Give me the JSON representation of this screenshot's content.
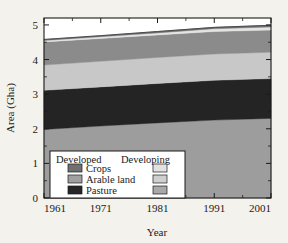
{
  "chart_data": {
    "type": "area",
    "title": "",
    "subtitle": "",
    "xlabel": "Year",
    "ylabel": "Area (Gha)",
    "xlim": [
      1961,
      2001
    ],
    "ylim": [
      0,
      5.2
    ],
    "xticks": [
      1961,
      1971,
      1981,
      1991,
      2001
    ],
    "xticklabels": [
      "1961",
      "1971",
      "1981",
      "1991",
      "2001"
    ],
    "yticks": [
      0,
      1,
      2,
      3,
      4,
      5
    ],
    "yticklabels": [
      "0",
      "1",
      "2",
      "3",
      "4",
      "5"
    ],
    "grid": false,
    "stacked": true,
    "legend_position": "lower-left-inside",
    "x": [
      1961,
      1971,
      1981,
      1991,
      2001
    ],
    "series": [
      {
        "name": "Developing Pasture",
        "group": "Developing",
        "category": "Pasture",
        "color": "#9d9d9d",
        "values": [
          1.98,
          2.08,
          2.17,
          2.25,
          2.3
        ]
      },
      {
        "name": "Developed Pasture",
        "group": "Developed",
        "category": "Pasture",
        "color": "#242424",
        "values": [
          1.13,
          1.13,
          1.14,
          1.15,
          1.15
        ]
      },
      {
        "name": "Developing Arable land",
        "group": "Developing",
        "category": "Arable land",
        "color": "#c8c8c8",
        "values": [
          0.73,
          0.74,
          0.75,
          0.76,
          0.76
        ]
      },
      {
        "name": "Developed Arable land",
        "group": "Developed",
        "category": "Arable land",
        "color": "#8b8b8b",
        "values": [
          0.67,
          0.66,
          0.65,
          0.65,
          0.64
        ]
      },
      {
        "name": "Developing Crops",
        "group": "Developing",
        "category": "Crops",
        "color": "#e4e4e4",
        "values": [
          0.04,
          0.05,
          0.06,
          0.08,
          0.09
        ]
      },
      {
        "name": "Developed Crops",
        "group": "Developed",
        "category": "Crops",
        "color": "#707070",
        "values": [
          0.03,
          0.03,
          0.04,
          0.04,
          0.05
        ]
      }
    ],
    "cumulative_tops": {
      "developing_pasture": [
        1.98,
        2.08,
        2.17,
        2.25,
        2.3
      ],
      "developed_pasture": [
        3.11,
        3.21,
        3.31,
        3.4,
        3.45
      ],
      "developing_arable": [
        3.84,
        3.95,
        4.06,
        4.16,
        4.21
      ],
      "developed_arable": [
        4.51,
        4.61,
        4.71,
        4.81,
        4.85
      ],
      "developing_crops": [
        4.55,
        4.66,
        4.77,
        4.89,
        4.94
      ],
      "developed_crops": [
        4.58,
        4.69,
        4.81,
        4.93,
        4.99
      ]
    }
  },
  "axes": {
    "ylabel": "Area (Gha)",
    "xlabel": "Year",
    "xticklabels": [
      "1961",
      "1971",
      "1981",
      "1991",
      "2001"
    ],
    "yticklabels": [
      "0",
      "1",
      "2",
      "3",
      "4",
      "5"
    ]
  },
  "legend": {
    "header_left": "Developed",
    "header_right": "Developing",
    "rows": [
      {
        "label": "Crops",
        "developed_color": "#707070",
        "developing_color": "#e2e2e2"
      },
      {
        "label": "Arable land",
        "developed_color": "#a0a0a0",
        "developing_color": "#cfcfcf"
      },
      {
        "label": "Pasture",
        "developed_color": "#262626",
        "developing_color": "#a8a8a8"
      }
    ]
  },
  "colors": {
    "figure_background": "#f4f2ec",
    "plot_background": "#ffffff",
    "axis": "#1a1a1a",
    "legend_background": "#ffffff",
    "legend_border": "#1a1a1a"
  }
}
